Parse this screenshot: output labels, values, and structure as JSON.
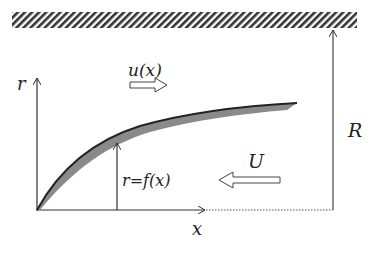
{
  "diagram": {
    "type": "axisymmetric body in pipe flow",
    "labels": {
      "r_axis": "r",
      "x_axis": "x",
      "local_velocity": "u(x)",
      "free_stream": "U",
      "radius": "R",
      "surface": "r=f(x)"
    },
    "elements": [
      "hatched wall at top",
      "r-axis arrow (vertical)",
      "x-axis arrow (horizontal) with dotted continuation",
      "shaded body profile curve r=f(x)",
      "vertical arrow indicating r=f(x) at a station",
      "right-pointing hollow arrow for u(x)",
      "left-pointing hollow arrow for U",
      "vertical arrow indicating pipe radius R"
    ],
    "colors": {
      "line": "#333333",
      "body_fill": "#8a8a8a",
      "hatch": "#333333"
    }
  }
}
